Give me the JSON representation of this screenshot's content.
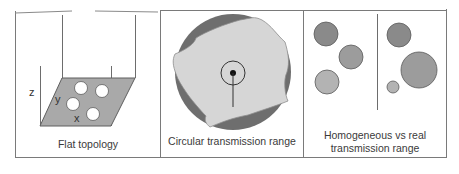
{
  "figure": {
    "panels": [
      {
        "id": "flat-topology",
        "caption": "Flat topology",
        "axis_labels": {
          "x": "x",
          "y": "y",
          "z": "z"
        },
        "node_count": 4
      },
      {
        "id": "circular-transmission-range",
        "caption": "Circular transmission range"
      },
      {
        "id": "homogeneous-vs-real",
        "caption_line1": "Homogeneous vs real",
        "caption_line2": "transmission range",
        "left_group": "homogeneous",
        "right_group": "real"
      }
    ]
  },
  "colors": {
    "frame": "#7a7a7a",
    "plane": "#a9a9a9",
    "node_fill": "#ffffff",
    "range_dark": "#6e6e6e",
    "range_blob": "#d6d6d6",
    "circle_dark": "#8a8a8a",
    "circle_medium": "#9c9c9c",
    "circle_light": "#b3b3b3"
  }
}
